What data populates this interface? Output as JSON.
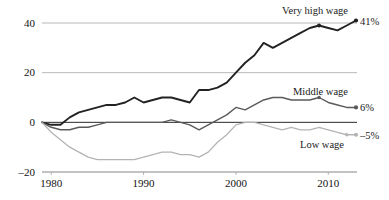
{
  "chart_data": {
    "type": "line",
    "title": "",
    "subtitle": "",
    "xlabel": "",
    "ylabel": "",
    "xlim": [
      1979,
      2013
    ],
    "ylim": [
      -20,
      40
    ],
    "yticks": [
      "40",
      "20",
      "0",
      "–20"
    ],
    "ytick_values": [
      40,
      20,
      0,
      -20
    ],
    "xticks": [
      "1980",
      "1990",
      "2000",
      "2010"
    ],
    "xtick_values": [
      1980,
      1990,
      2000,
      2010
    ],
    "grid": "horizontal",
    "legend_position": "inline-right",
    "zero_reference_line": true,
    "series": [
      {
        "name": "Very high wage",
        "label": "Very high wage",
        "end_label": "41%",
        "end_value": 41,
        "color": "#222222",
        "stroke_width": 1.9,
        "x": [
          1979,
          1980,
          1981,
          1982,
          1983,
          1984,
          1985,
          1986,
          1987,
          1988,
          1989,
          1990,
          1991,
          1992,
          1993,
          1994,
          1995,
          1996,
          1997,
          1998,
          1999,
          2000,
          2001,
          2002,
          2003,
          2004,
          2005,
          2006,
          2007,
          2008,
          2009,
          2010,
          2011,
          2012,
          2013
        ],
        "values": [
          0,
          -1,
          -1,
          2,
          4,
          5,
          6,
          7,
          7,
          8,
          10,
          8,
          9,
          10,
          10,
          9,
          8,
          13,
          13,
          14,
          16,
          20,
          24,
          27,
          32,
          30,
          32,
          34,
          36,
          38,
          39,
          38,
          37,
          39,
          41
        ]
      },
      {
        "name": "Middle wage",
        "label": "Middle wage",
        "end_label": "6%",
        "end_value": 6,
        "color": "#5a5a5a",
        "stroke_width": 1.4,
        "x": [
          1979,
          1980,
          1981,
          1982,
          1983,
          1984,
          1985,
          1986,
          1987,
          1988,
          1989,
          1990,
          1991,
          1992,
          1993,
          1994,
          1995,
          1996,
          1997,
          1998,
          1999,
          2000,
          2001,
          2002,
          2003,
          2004,
          2005,
          2006,
          2007,
          2008,
          2009,
          2010,
          2011,
          2012,
          2013
        ],
        "values": [
          0,
          -2,
          -3,
          -3,
          -2,
          -2,
          -1,
          0,
          0,
          0,
          0,
          0,
          0,
          0,
          1,
          0,
          -1,
          -3,
          -1,
          1,
          3,
          6,
          5,
          7,
          9,
          10,
          10,
          9,
          9,
          9,
          10,
          8,
          7,
          6,
          6
        ]
      },
      {
        "name": "Low wage",
        "label": "Low wage",
        "end_label": "–5%",
        "end_value": -5,
        "color": "#b4b4b4",
        "stroke_width": 1.3,
        "x": [
          1979,
          1980,
          1981,
          1982,
          1983,
          1984,
          1985,
          1986,
          1987,
          1988,
          1989,
          1990,
          1991,
          1992,
          1993,
          1994,
          1995,
          1996,
          1997,
          1998,
          1999,
          2000,
          2001,
          2002,
          2003,
          2004,
          2005,
          2006,
          2007,
          2008,
          2009,
          2010,
          2011,
          2012,
          2013
        ],
        "values": [
          0,
          -4,
          -7,
          -10,
          -12,
          -14,
          -15,
          -15,
          -15,
          -15,
          -15,
          -14,
          -13,
          -12,
          -12,
          -13,
          -13,
          -14,
          -12,
          -8,
          -5,
          -1,
          0,
          0,
          -1,
          -2,
          -3,
          -2,
          -3,
          -3,
          -2,
          -3,
          -4,
          -5,
          -5
        ]
      }
    ]
  }
}
